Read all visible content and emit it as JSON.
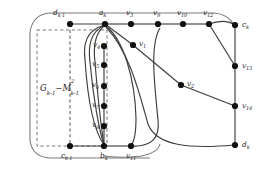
{
  "figure": {
    "caption_label": "graph-construction-diagram",
    "colors": {
      "edge": "#3d3d3d",
      "node": "#111111",
      "dashed_box": "#666666",
      "outer_boundary": "#7a7a7a",
      "background": "#ffffff",
      "text": "#1a1a1a"
    },
    "region_label": {
      "base": "G",
      "base_sub": "k-1",
      "minus": "−",
      "second": "M",
      "second_sup": "2",
      "second_sub": "k-1"
    }
  },
  "graph_data": {
    "type": "diagram",
    "nodes": [
      {
        "id": "d_{k-1}",
        "name": "d",
        "sub": "k-1",
        "x": 70,
        "y": 24,
        "label_dx": -13,
        "label_dy": -11
      },
      {
        "id": "a_k",
        "name": "a",
        "sub": "k",
        "x": 105,
        "y": 24,
        "label_dx": -4,
        "label_dy": -11
      },
      {
        "id": "v_3",
        "name": "v",
        "sub": "3",
        "x": 131,
        "y": 24,
        "label_dx": -4,
        "label_dy": -11
      },
      {
        "id": "v_9",
        "name": "v",
        "sub": "9",
        "x": 158,
        "y": 24,
        "label_dx": -4,
        "label_dy": -11
      },
      {
        "id": "v_10",
        "name": "v",
        "sub": "10",
        "x": 183,
        "y": 24,
        "label_dx": -5,
        "label_dy": -11
      },
      {
        "id": "v_12",
        "name": "v",
        "sub": "12",
        "x": 209,
        "y": 24,
        "label_dx": -5,
        "label_dy": -11
      },
      {
        "id": "c_k",
        "name": "c",
        "sub": "k",
        "x": 235,
        "y": 25,
        "label_dx": 5,
        "label_dy": -2
      },
      {
        "id": "v_13",
        "name": "v",
        "sub": "13",
        "x": 235,
        "y": 66,
        "label_dx": 5,
        "label_dy": 3
      },
      {
        "id": "v_14",
        "name": "v",
        "sub": "14",
        "x": 235,
        "y": 106,
        "label_dx": 5,
        "label_dy": 3
      },
      {
        "id": "d_k",
        "name": "d",
        "sub": "k",
        "x": 235,
        "y": 145,
        "label_dx": 5,
        "label_dy": 3
      },
      {
        "id": "v_1",
        "name": "v",
        "sub": "1",
        "x": 133,
        "y": 45,
        "label_dx": 5,
        "label_dy": -1
      },
      {
        "id": "v_2",
        "name": "v",
        "sub": "2",
        "x": 181,
        "y": 85,
        "label_dx": 5,
        "label_dy": -1
      },
      {
        "id": "v_4",
        "name": "v",
        "sub": "4",
        "x": 104,
        "y": 46,
        "label_dx": -11,
        "label_dy": 0
      },
      {
        "id": "v_5",
        "name": "v",
        "sub": "5",
        "x": 104,
        "y": 65,
        "label_dx": -11,
        "label_dy": 0
      },
      {
        "id": "v_6",
        "name": "v",
        "sub": "6",
        "x": 104,
        "y": 86,
        "label_dx": -11,
        "label_dy": 0
      },
      {
        "id": "v_7",
        "name": "v",
        "sub": "7",
        "x": 104,
        "y": 106,
        "label_dx": -11,
        "label_dy": 0
      },
      {
        "id": "v_8",
        "name": "v",
        "sub": "8",
        "x": 104,
        "y": 126,
        "label_dx": -11,
        "label_dy": 0
      },
      {
        "id": "c_{k-1}",
        "name": "c",
        "sub": "k-1",
        "x": 70,
        "y": 146,
        "label_dx": -7,
        "label_dy": 8
      },
      {
        "id": "b_k",
        "name": "b",
        "sub": "k",
        "x": 104,
        "y": 146,
        "label_dx": -2,
        "label_dy": 8
      },
      {
        "id": "v_11",
        "name": "v",
        "sub": "11",
        "x": 131,
        "y": 146,
        "label_dx": -3,
        "label_dy": 8
      }
    ],
    "straight_edges": [
      [
        "d_{k-1}",
        "a_k"
      ],
      [
        "a_k",
        "v_3"
      ],
      [
        "v_3",
        "v_9"
      ],
      [
        "v_9",
        "v_10"
      ],
      [
        "v_10",
        "v_12"
      ],
      [
        "c_k",
        "v_13"
      ],
      [
        "v_13",
        "v_14"
      ],
      [
        "v_14",
        "d_k"
      ],
      [
        "v_12",
        "v_13"
      ],
      [
        "a_k",
        "v_1"
      ],
      [
        "v_1",
        "v_2"
      ],
      [
        "v_2",
        "v_14"
      ],
      [
        "v_4",
        "v_5"
      ],
      [
        "v_5",
        "v_6"
      ],
      [
        "v_6",
        "v_7"
      ],
      [
        "v_7",
        "v_8"
      ],
      [
        "v_8",
        "b_k"
      ],
      [
        "c_{k-1}",
        "b_k"
      ],
      [
        "b_k",
        "v_11"
      ],
      [
        "d_{k-1}",
        "c_{k-1}"
      ]
    ],
    "curved_edges": [
      {
        "from": "v_12",
        "to": "c_k",
        "note": "top-right arc"
      },
      {
        "from": "v_4",
        "to": "b_k",
        "note": "inner left loop"
      },
      {
        "from": "v_5",
        "to": "b_k",
        "note": "inner loop 2"
      },
      {
        "from": "v_4",
        "to": "v_11",
        "note": "loop to v11"
      },
      {
        "from": "a_k",
        "to": "d_k",
        "note": "long sweeping arc to d_k"
      },
      {
        "from": "v_11",
        "to": "c_k",
        "note": "outer sweep"
      },
      {
        "from": "d_{k-1}",
        "to": "c_{k-1}",
        "note": "outer rounded boundary"
      }
    ]
  }
}
